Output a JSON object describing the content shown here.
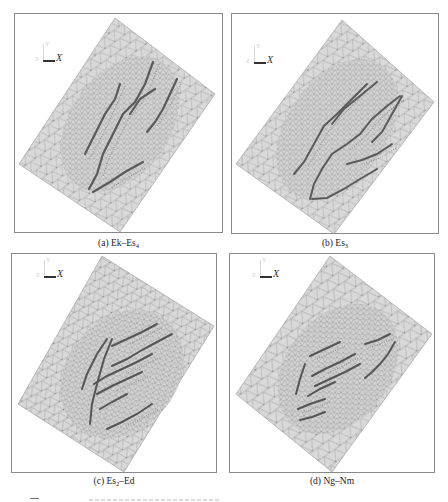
{
  "figure": {
    "panels": [
      {
        "id": "a",
        "caption_prefix": "(a) Ek–Es",
        "caption_sub": "4",
        "caption_suffix": "",
        "axis": {
          "x_label": "X",
          "y_label": "Y",
          "z_label": "Z"
        }
      },
      {
        "id": "b",
        "caption_prefix": "(b) Es",
        "caption_sub": "3",
        "caption_suffix": "",
        "axis": {
          "x_label": "X",
          "y_label": "Y",
          "z_label": "Z"
        }
      },
      {
        "id": "c",
        "caption_prefix": "(c) Es",
        "caption_sub": "2",
        "caption_suffix": "–Ed",
        "axis": {
          "x_label": "X",
          "y_label": "Y",
          "z_label": "Z"
        }
      },
      {
        "id": "d",
        "caption_prefix": "(d) Ng–Nm",
        "caption_sub": "",
        "caption_suffix": "",
        "axis": {
          "x_label": "X",
          "y_label": "Y",
          "z_label": "Z"
        }
      }
    ],
    "figure_caption_glyph": "图",
    "colors": {
      "mesh_fill": "#d9d9d9",
      "mesh_line": "#8c8c8c",
      "fault_line": "#555555",
      "frame": "#8a8a8a"
    }
  }
}
